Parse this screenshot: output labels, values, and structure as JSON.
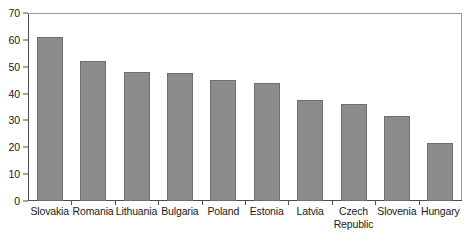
{
  "chart_data": {
    "type": "bar",
    "title": "",
    "xlabel": "",
    "ylabel": "",
    "categories": [
      "Slovakia",
      "Romania",
      "Lithuania",
      "Bulgaria",
      "Poland",
      "Estonia",
      "Latvia",
      "Czech Republic",
      "Slovenia",
      "Hungary"
    ],
    "category_lines": [
      [
        "Slovakia"
      ],
      [
        "Romania"
      ],
      [
        "Lithuania"
      ],
      [
        "Bulgaria"
      ],
      [
        "Poland"
      ],
      [
        "Estonia"
      ],
      [
        "Latvia"
      ],
      [
        "Czech",
        "Republic"
      ],
      [
        "Slovenia"
      ],
      [
        "Hungary"
      ]
    ],
    "values": [
      61,
      52,
      48,
      47.5,
      45,
      44,
      37.5,
      36,
      31.5,
      21.5
    ],
    "ylim": [
      0,
      70
    ],
    "ytick_labels": [
      "0",
      "10",
      "20",
      "30",
      "40",
      "50",
      "60",
      "70"
    ],
    "ytick_values": [
      0,
      10,
      20,
      30,
      40,
      50,
      60,
      70
    ],
    "grid": false,
    "legend": null,
    "bar_color": "#8c8c8c",
    "bar_border_color": "#6f6f6f",
    "axis_color": "#4d4d4d",
    "frame_color": "#9a9a9a",
    "text_color": "#1a1a1a"
  }
}
